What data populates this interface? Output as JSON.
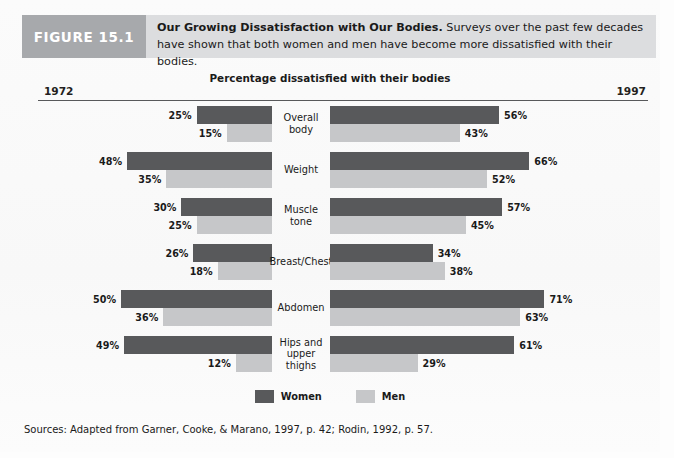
{
  "figure": {
    "tag": "FIGURE 15.1",
    "caption_bold": "Our Growing Dissatisfaction with Our Bodies.",
    "caption_rest": " Surveys over the past few decades have shown that both women and men have become more dissatisfied with their bodies.",
    "sources": "Sources: Adapted from Garner, Cooke, & Marano, 1997, p. 42; Rodin, 1992, p. 57."
  },
  "colors": {
    "women": "#58595b",
    "men": "#c6c7c9",
    "tag_band": "#a7a9ac",
    "caption_band": "#dcdddf",
    "rule": "#58595b"
  },
  "chart_data": {
    "type": "bar",
    "title": "Percentage dissatisfied with their bodies",
    "subtitle": "",
    "xlabel": "",
    "ylabel": "",
    "xlim": [
      0,
      75
    ],
    "grid": false,
    "legend_position": "bottom",
    "orientation": "horizontal-diverging",
    "left_axis_label": "1972",
    "right_axis_label": "1997",
    "categories": [
      "Overall body",
      "Weight",
      "Muscle tone",
      "Breast/Chest",
      "Abdomen",
      "Hips and upper thighs"
    ],
    "series": [
      {
        "name": "Women",
        "year": "1972",
        "side": "left",
        "color": "#58595b",
        "values": [
          25,
          48,
          30,
          26,
          50,
          49
        ]
      },
      {
        "name": "Men",
        "year": "1972",
        "side": "left",
        "color": "#c6c7c9",
        "values": [
          15,
          35,
          25,
          18,
          36,
          12
        ]
      },
      {
        "name": "Women",
        "year": "1997",
        "side": "right",
        "color": "#58595b",
        "values": [
          56,
          66,
          57,
          34,
          71,
          61
        ]
      },
      {
        "name": "Men",
        "year": "1997",
        "side": "right",
        "color": "#c6c7c9",
        "values": [
          43,
          52,
          45,
          38,
          63,
          29
        ]
      }
    ],
    "rows": [
      {
        "category": "Overall body",
        "category_line1": "Overall body",
        "category_line2": "",
        "left": {
          "women": "25%",
          "men": "15%",
          "women_val": 25,
          "men_val": 15
        },
        "right": {
          "women": "56%",
          "men": "43%",
          "women_val": 56,
          "men_val": 43
        }
      },
      {
        "category": "Weight",
        "category_line1": "Weight",
        "category_line2": "",
        "left": {
          "women": "48%",
          "men": "35%",
          "women_val": 48,
          "men_val": 35
        },
        "right": {
          "women": "66%",
          "men": "52%",
          "women_val": 66,
          "men_val": 52
        }
      },
      {
        "category": "Muscle tone",
        "category_line1": "Muscle tone",
        "category_line2": "",
        "left": {
          "women": "30%",
          "men": "25%",
          "women_val": 30,
          "men_val": 25
        },
        "right": {
          "women": "57%",
          "men": "45%",
          "women_val": 57,
          "men_val": 45
        }
      },
      {
        "category": "Breast/Chest",
        "category_line1": "Breast/Chest",
        "category_line2": "",
        "left": {
          "women": "26%",
          "men": "18%",
          "women_val": 26,
          "men_val": 18
        },
        "right": {
          "women": "34%",
          "men": "38%",
          "women_val": 34,
          "men_val": 38
        }
      },
      {
        "category": "Abdomen",
        "category_line1": "Abdomen",
        "category_line2": "",
        "left": {
          "women": "50%",
          "men": "36%",
          "women_val": 50,
          "men_val": 36
        },
        "right": {
          "women": "71%",
          "men": "63%",
          "women_val": 71,
          "men_val": 63
        }
      },
      {
        "category": "Hips and upper thighs",
        "category_line1": "Hips and",
        "category_line2": "upper thighs",
        "left": {
          "women": "49%",
          "men": "12%",
          "women_val": 49,
          "men_val": 12
        },
        "right": {
          "women": "61%",
          "men": "29%",
          "women_val": 61,
          "men_val": 29
        }
      }
    ],
    "legend": [
      {
        "label": "Women",
        "color": "#58595b"
      },
      {
        "label": "Men",
        "color": "#c6c7c9"
      }
    ]
  }
}
